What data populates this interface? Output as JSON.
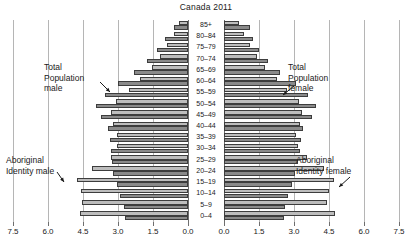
{
  "chart": {
    "title": "Canada 2011",
    "type": "population-pyramid"
  },
  "annotations": {
    "total_male": {
      "line1": "Total",
      "line2": "Population",
      "line3": "male"
    },
    "total_female": {
      "line1": "Total",
      "line2": "Population",
      "line3": "female"
    },
    "aboriginal_male": {
      "line1": "Aboriginal",
      "line2": "Identity male"
    },
    "aboriginal_female": {
      "line1": "Aboriginal",
      "line2": "Identity female"
    }
  },
  "axis": {
    "ticks_left": [
      "7.5",
      "6.0",
      "4.5",
      "3.0",
      "1.5",
      "0.0"
    ],
    "ticks_right": [
      "0.0",
      "1.5",
      "3.0",
      "4.5",
      "6.0",
      "7.5"
    ]
  },
  "colors": {
    "total": "#8a8a8a",
    "aboriginal": "#bdbdbd",
    "grid": "#b5b5b5",
    "axis": "#6e6e6e",
    "text": "#1a1a1a"
  },
  "chart_data": {
    "type": "bar",
    "title": "Canada 2011",
    "xlabel": "",
    "ylabel": "",
    "orientation": "horizontal-pyramid",
    "xlim": [
      0,
      7.5
    ],
    "xticks": [
      0.0,
      1.5,
      3.0,
      4.5,
      6.0,
      7.5
    ],
    "grid": true,
    "legend": "annotations",
    "categories": [
      "0–4",
      "5–9",
      "10–14",
      "15–19",
      "20–24",
      "25–29",
      "30–34",
      "35–39",
      "40–44",
      "45–49",
      "50–54",
      "55–59",
      "60–64",
      "65–69",
      "70–74",
      "75–79",
      "80–84",
      "85+"
    ],
    "series": [
      {
        "name": "Total Population male",
        "side": "left",
        "values": [
          2.7,
          2.75,
          2.9,
          3.05,
          3.2,
          3.25,
          3.3,
          3.35,
          3.45,
          3.75,
          3.95,
          3.55,
          3.0,
          2.3,
          1.75,
          1.35,
          1.0,
          0.6
        ]
      },
      {
        "name": "Aboriginal Identity male",
        "side": "left",
        "values": [
          4.65,
          4.55,
          4.6,
          4.75,
          4.1,
          3.3,
          3.05,
          3.05,
          3.2,
          3.3,
          3.1,
          2.55,
          2.05,
          1.55,
          1.2,
          0.9,
          0.6,
          0.4
        ]
      },
      {
        "name": "Total Population female",
        "side": "right",
        "values": [
          2.55,
          2.6,
          2.75,
          2.9,
          3.05,
          3.15,
          3.25,
          3.3,
          3.4,
          3.75,
          3.95,
          3.6,
          3.1,
          2.4,
          1.9,
          1.5,
          1.25,
          1.1
        ]
      },
      {
        "name": "Aboriginal Identity female",
        "side": "right",
        "values": [
          4.75,
          4.4,
          4.5,
          4.7,
          4.3,
          3.55,
          3.15,
          3.1,
          3.25,
          3.35,
          3.2,
          2.7,
          2.25,
          1.75,
          1.4,
          1.1,
          0.85,
          0.65
        ]
      }
    ]
  }
}
